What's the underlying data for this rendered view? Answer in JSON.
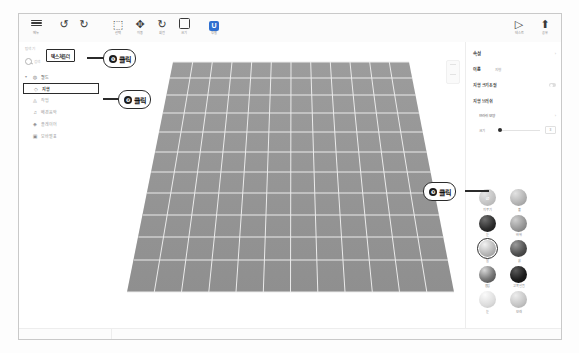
{
  "window": {
    "title_bar_visible": false
  },
  "toolbar": {
    "items": [
      {
        "name": "menu",
        "icon": "hamburger-icon",
        "label": "메뉴"
      },
      {
        "name": "undo",
        "icon": "undo-icon",
        "label": ""
      },
      {
        "name": "redo",
        "icon": "redo-icon",
        "label": ""
      },
      {
        "name": "select",
        "icon": "select-icon",
        "label": "선택"
      },
      {
        "name": "move",
        "icon": "move-icon",
        "label": "이동"
      },
      {
        "name": "rotate",
        "icon": "rotate-icon",
        "label": "회전"
      },
      {
        "name": "scale",
        "icon": "scale-icon",
        "label": "크기"
      },
      {
        "name": "unity-badge",
        "icon": "u-badge-icon",
        "label": "정렬"
      }
    ],
    "right_items": [
      {
        "name": "play",
        "icon": "play-icon",
        "label": "테스트"
      },
      {
        "name": "publish",
        "icon": "upload-icon",
        "label": "공유"
      }
    ]
  },
  "left_panel": {
    "title": "탐색기",
    "explorer_chip": "텍스쳐폴더",
    "search_placeholder": "검색",
    "tree": [
      {
        "label": "월드",
        "icon": "globe-icon",
        "indent": 0,
        "selected": false,
        "dim": false,
        "caret": "▾"
      },
      {
        "label": "지형",
        "icon": "circle-icon",
        "indent": 1,
        "selected": true,
        "dim": false,
        "caret": ""
      },
      {
        "label": "작업",
        "icon": "layer-icon",
        "indent": 1,
        "selected": false,
        "dim": true,
        "caret": ""
      },
      {
        "label": "배경음악",
        "icon": "music-icon",
        "indent": 1,
        "selected": false,
        "dim": true,
        "caret": ""
      },
      {
        "label": "플레이어",
        "icon": "person-icon",
        "indent": 1,
        "selected": false,
        "dim": true,
        "caret": ""
      },
      {
        "label": "모바별표",
        "icon": "box-icon",
        "indent": 0,
        "selected": false,
        "dim": true,
        "caret": ""
      }
    ]
  },
  "viewport": {
    "terrain_name": "지형 그리드 평면",
    "grid_cols": 12,
    "grid_rows": 14,
    "terrain_fill": "#9a9a9a",
    "grid_line_color": "#e8e8e8"
  },
  "right_panel": {
    "header": "속성",
    "rows": [
      {
        "label": "이름",
        "value": "지형",
        "control": "chevron"
      },
      {
        "label": "지형 크기조절",
        "value": "",
        "control": "toggle"
      },
      {
        "label": "지형 브러쉬",
        "value": "",
        "control": "none"
      }
    ],
    "brush_shape_label": "브러쉬 모양",
    "size_label": "크기",
    "size_value": "3",
    "materials": [
      {
        "label": "지우기",
        "color": "#c9c9c9",
        "selected": false,
        "eraser": true
      },
      {
        "label": "풀",
        "color": "#b4b4b4",
        "selected": false,
        "eraser": false
      },
      {
        "label": "눈",
        "color": "#2e2e2e",
        "selected": false,
        "eraser": false
      },
      {
        "label": "바위",
        "color": "#8e8e8e",
        "selected": false,
        "eraser": false
      },
      {
        "label": "물",
        "color": "#a8a8a8",
        "selected": true,
        "eraser": false
      },
      {
        "label": "흙",
        "color": "#4a4a4a",
        "selected": false,
        "eraser": false
      },
      {
        "label": "용암",
        "color": "#5a5a5a",
        "selected": false,
        "eraser": false
      },
      {
        "label": "고목 얼음",
        "color": "#1f1f1f",
        "selected": false,
        "eraser": false
      },
      {
        "label": "눈",
        "color": "#d5d5d5",
        "selected": false,
        "eraser": false
      },
      {
        "label": "모래",
        "color": "#c0c0c0",
        "selected": false,
        "eraser": false
      }
    ]
  },
  "callouts": [
    {
      "num": "❶",
      "text": "클릭"
    },
    {
      "num": "❷",
      "text": "클릭"
    },
    {
      "num": "❸",
      "text": "클릭"
    }
  ]
}
